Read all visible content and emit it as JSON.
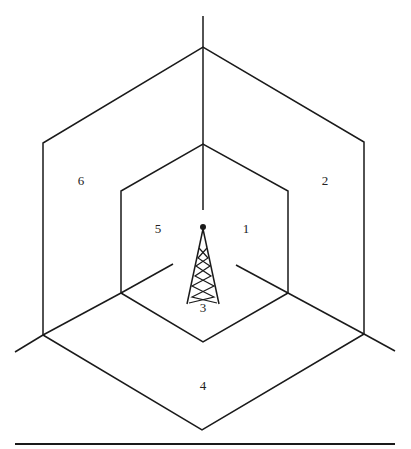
{
  "diagram": {
    "type": "sectorized cell layout (hexagonal, tower at center)",
    "line_color": "#1a1a1a",
    "background": "#ffffff",
    "center_tower": {
      "icon": "antenna-tower-icon",
      "label": "3"
    },
    "sectors": [
      {
        "id": "1",
        "label": "1",
        "x": 246,
        "y": 228
      },
      {
        "id": "2",
        "label": "2",
        "x": 325,
        "y": 180
      },
      {
        "id": "3",
        "label": "3",
        "x": 203,
        "y": 307
      },
      {
        "id": "4",
        "label": "4",
        "x": 203,
        "y": 385
      },
      {
        "id": "5",
        "label": "5",
        "x": 158,
        "y": 228
      },
      {
        "id": "6",
        "label": "6",
        "x": 81,
        "y": 180
      }
    ]
  }
}
